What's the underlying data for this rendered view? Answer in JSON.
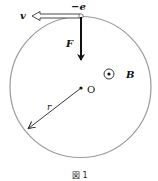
{
  "figure": {
    "caption": "図 1",
    "labels": {
      "charge": "−e",
      "velocity": "v",
      "force": "F",
      "field": "B",
      "center": "O",
      "radius": "r"
    },
    "field_symbol": "out-of-page (dot in circle)",
    "colors": {
      "circle": "#9a9a9a",
      "arrows": "#111111",
      "text": "#111111"
    }
  }
}
